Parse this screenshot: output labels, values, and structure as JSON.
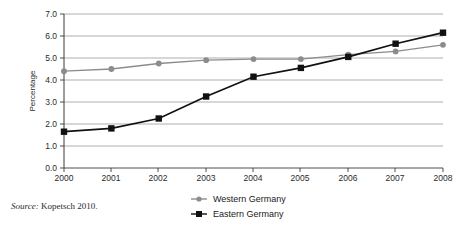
{
  "figure": {
    "source_note": {
      "label": "Source:",
      "text": "Kopetsch 2010."
    }
  },
  "chart_data": {
    "type": "line",
    "title": "",
    "subtitle": "",
    "xlabel": "",
    "ylabel": "Percentage",
    "categories": [
      "2000",
      "2001",
      "2002",
      "2003",
      "2004",
      "2005",
      "2006",
      "2007",
      "2008"
    ],
    "x": [
      2000,
      2001,
      2002,
      2003,
      2004,
      2005,
      2006,
      2007,
      2008
    ],
    "xlim": [
      2000,
      2008
    ],
    "ylim": [
      0.0,
      7.0
    ],
    "yticks": [
      "0.0",
      "1.0",
      "2.0",
      "3.0",
      "4.0",
      "5.0",
      "6.0",
      "7.0"
    ],
    "ytick_values": [
      0.0,
      1.0,
      2.0,
      3.0,
      4.0,
      5.0,
      6.0,
      7.0
    ],
    "grid": "horizontal",
    "legend_position": "bottom-center",
    "series": [
      {
        "name": "Western Germany",
        "color": "#8c8c8c",
        "marker": "circle",
        "values": [
          4.4,
          4.5,
          4.75,
          4.9,
          4.95,
          4.95,
          5.15,
          5.3,
          5.6
        ]
      },
      {
        "name": "Eastern Germany",
        "color": "#111111",
        "marker": "square",
        "values": [
          1.65,
          1.8,
          2.25,
          3.25,
          4.15,
          4.55,
          5.05,
          5.65,
          6.15
        ]
      }
    ]
  }
}
